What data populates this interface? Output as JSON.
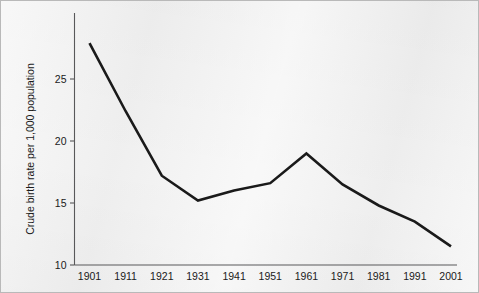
{
  "chart_data": {
    "type": "line",
    "title": "",
    "subtitle": "",
    "xlabel": "",
    "ylabel": "Crude birth rate per 1,000 population",
    "x": [
      1901,
      1911,
      1921,
      1931,
      1941,
      1951,
      1961,
      1971,
      1981,
      1991,
      2001
    ],
    "xtick_labels": [
      "1901",
      "1911",
      "1921",
      "1931",
      "1941",
      "1951",
      "1961",
      "1971",
      "1981",
      "1991",
      "2001"
    ],
    "values": [
      27.9,
      22.4,
      17.2,
      15.2,
      16.0,
      16.6,
      19.0,
      16.5,
      14.8,
      13.5,
      11.5
    ],
    "ytick_labels": [
      "10",
      "15",
      "20",
      "25"
    ],
    "yticks": [
      10,
      15,
      20,
      25
    ],
    "ylim": [
      9.2,
      29.3
    ],
    "xlim": [
      1899.2,
      2002.6
    ],
    "grid": false,
    "legend": null,
    "annotations": [],
    "series": [
      {
        "name": "Crude birth rate",
        "values": [
          27.9,
          22.4,
          17.2,
          15.2,
          16.0,
          16.6,
          19.0,
          16.5,
          14.8,
          13.5,
          11.5
        ]
      }
    ]
  },
  "style": {
    "background_color": "#f2f2f2",
    "border_color": "#b9b9b9",
    "axis_color": "#58585a",
    "line_color": "#1a1a1a",
    "text_color": "#1a1a1a"
  }
}
